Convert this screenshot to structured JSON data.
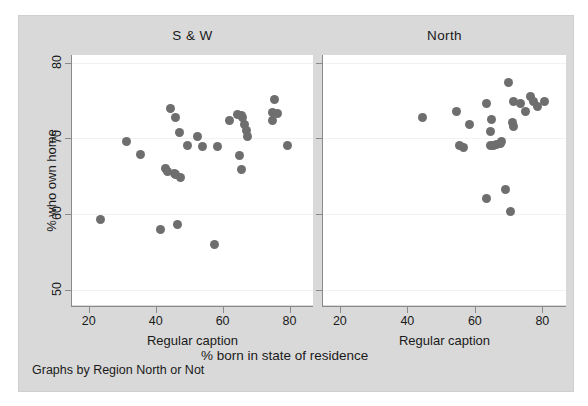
{
  "chart_data": {
    "type": "scatter",
    "title": "",
    "xlabel": "% born in state of residence",
    "ylabel": "% who own home",
    "note": "Graphs by Region North or Not",
    "grid": true,
    "legend": "none",
    "marker_color": "#6e6e6e",
    "panel_background": "#ffffff",
    "graph_background": "#d9d9d9",
    "xlim": [
      15,
      87
    ],
    "ylim": [
      48,
      81
    ],
    "xticks": [
      20,
      40,
      60,
      80
    ],
    "yticks": [
      50,
      60,
      70,
      80
    ],
    "panels": [
      {
        "label": "S & W",
        "caption": "Regular caption",
        "points": [
          {
            "x": 23.5,
            "y": 59.3
          },
          {
            "x": 31.2,
            "y": 69.6
          },
          {
            "x": 35.5,
            "y": 67.9
          },
          {
            "x": 41.5,
            "y": 58.0
          },
          {
            "x": 43.0,
            "y": 66.0
          },
          {
            "x": 43.5,
            "y": 65.6
          },
          {
            "x": 45.5,
            "y": 65.4
          },
          {
            "x": 46.0,
            "y": 65.2
          },
          {
            "x": 46.5,
            "y": 58.6
          },
          {
            "x": 47.0,
            "y": 70.8
          },
          {
            "x": 47.5,
            "y": 64.8
          },
          {
            "x": 44.5,
            "y": 74.0
          },
          {
            "x": 46.0,
            "y": 72.7
          },
          {
            "x": 49.5,
            "y": 69.0
          },
          {
            "x": 52.5,
            "y": 70.3
          },
          {
            "x": 54.0,
            "y": 68.9
          },
          {
            "x": 57.5,
            "y": 56.0
          },
          {
            "x": 58.5,
            "y": 68.9
          },
          {
            "x": 62.0,
            "y": 72.4
          },
          {
            "x": 64.5,
            "y": 73.1
          },
          {
            "x": 65.5,
            "y": 73.0
          },
          {
            "x": 66.0,
            "y": 72.8
          },
          {
            "x": 66.5,
            "y": 71.8
          },
          {
            "x": 67.0,
            "y": 71.0
          },
          {
            "x": 67.5,
            "y": 70.3
          },
          {
            "x": 65.0,
            "y": 67.7
          },
          {
            "x": 65.5,
            "y": 65.9
          },
          {
            "x": 75.5,
            "y": 75.1
          },
          {
            "x": 75.0,
            "y": 73.4
          },
          {
            "x": 76.5,
            "y": 73.3
          },
          {
            "x": 75.0,
            "y": 72.3
          },
          {
            "x": 79.5,
            "y": 69.0
          }
        ]
      },
      {
        "label": "North",
        "caption": "Regular caption",
        "points": [
          {
            "x": 44.5,
            "y": 72.7
          },
          {
            "x": 54.5,
            "y": 73.6
          },
          {
            "x": 55.5,
            "y": 69.1
          },
          {
            "x": 56.5,
            "y": 68.8
          },
          {
            "x": 58.5,
            "y": 71.8
          },
          {
            "x": 63.5,
            "y": 74.6
          },
          {
            "x": 63.5,
            "y": 62.1
          },
          {
            "x": 65.0,
            "y": 72.5
          },
          {
            "x": 64.5,
            "y": 70.9
          },
          {
            "x": 64.5,
            "y": 69.1
          },
          {
            "x": 65.5,
            "y": 69.0
          },
          {
            "x": 66.5,
            "y": 69.2
          },
          {
            "x": 67.5,
            "y": 69.3
          },
          {
            "x": 68.0,
            "y": 69.6
          },
          {
            "x": 69.0,
            "y": 63.2
          },
          {
            "x": 70.5,
            "y": 60.3
          },
          {
            "x": 70.0,
            "y": 77.4
          },
          {
            "x": 71.5,
            "y": 74.9
          },
          {
            "x": 71.0,
            "y": 72.1
          },
          {
            "x": 71.5,
            "y": 71.5
          },
          {
            "x": 73.5,
            "y": 74.6
          },
          {
            "x": 75.0,
            "y": 73.6
          },
          {
            "x": 76.5,
            "y": 75.5
          },
          {
            "x": 77.5,
            "y": 74.9
          },
          {
            "x": 78.5,
            "y": 74.2
          },
          {
            "x": 80.5,
            "y": 74.9
          }
        ]
      }
    ]
  },
  "axis": {
    "y_title": "% who own home",
    "y_ticks": [
      "80",
      "70",
      "60",
      "50"
    ],
    "x_ticks": [
      "20",
      "40",
      "60",
      "80"
    ],
    "x_title": "% born in state of residence"
  },
  "panel_left": {
    "title": "S & W",
    "caption": "Regular caption"
  },
  "panel_right": {
    "title": "North",
    "caption": "Regular caption"
  },
  "footer": {
    "note": "Graphs by Region North or Not"
  }
}
